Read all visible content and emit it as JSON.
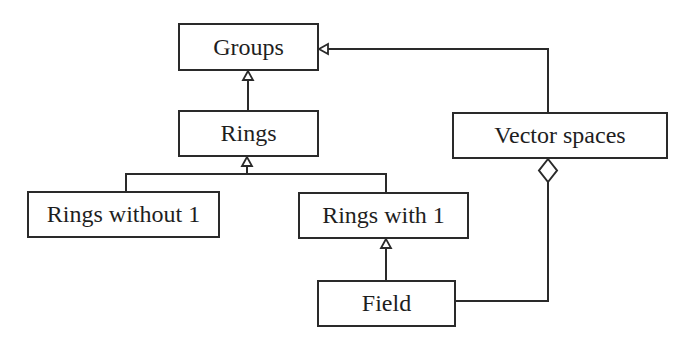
{
  "diagram": {
    "type": "uml-class-hierarchy",
    "nodes": {
      "groups": "Groups",
      "rings": "Rings",
      "rings_without_1": "Rings without 1",
      "rings_with_1": "Rings with 1",
      "vector_spaces": "Vector spaces",
      "field": "Field"
    },
    "edges": [
      {
        "from": "Rings",
        "to": "Groups",
        "kind": "inheritance"
      },
      {
        "from": "Vector spaces",
        "to": "Groups",
        "kind": "inheritance"
      },
      {
        "from": "Rings without 1",
        "to": "Rings",
        "kind": "inheritance"
      },
      {
        "from": "Rings with 1",
        "to": "Rings",
        "kind": "inheritance"
      },
      {
        "from": "Field",
        "to": "Rings with 1",
        "kind": "inheritance"
      },
      {
        "from": "Field",
        "to": "Vector spaces",
        "kind": "aggregation"
      }
    ]
  }
}
